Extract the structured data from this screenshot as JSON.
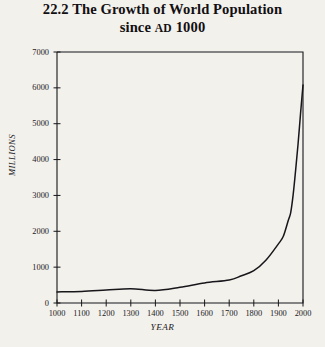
{
  "figure": {
    "title_line_1": "22.2 The Growth of World Population",
    "title_line_2_before": "since ",
    "title_line_2_smallcaps": "AD",
    "title_line_2_after": " 1000",
    "paper_color": "#f3f1ec",
    "ink_color": "#17161a"
  },
  "chart_data": {
    "type": "line",
    "title": "22.2 The Growth of World Population since AD 1000",
    "xlabel": "YEAR",
    "ylabel": "MILLIONS",
    "xlim": [
      1000,
      2000
    ],
    "ylim": [
      0,
      7000
    ],
    "xticks": [
      1000,
      1100,
      1200,
      1300,
      1400,
      1500,
      1600,
      1700,
      1800,
      1900,
      2000
    ],
    "yticks": [
      0,
      1000,
      2000,
      3000,
      4000,
      5000,
      6000,
      7000
    ],
    "xtick_labels": [
      "1000",
      "1100",
      "1200",
      "1300",
      "1400",
      "1500",
      "1600",
      "1700",
      "1800",
      "1900",
      "2000"
    ],
    "ytick_labels": [
      "0",
      "1000",
      "2000",
      "3000",
      "4000",
      "5000",
      "6000",
      "7000"
    ],
    "grid": false,
    "legend": false,
    "line_color": "#17161a",
    "series": [
      {
        "name": "World population",
        "x": [
          1000,
          1100,
          1200,
          1300,
          1400,
          1500,
          1600,
          1700,
          1750,
          1800,
          1850,
          1900,
          1920,
          1940,
          1950,
          1960,
          1970,
          1980,
          1990,
          2000
        ],
        "values": [
          310,
          320,
          360,
          400,
          350,
          440,
          560,
          640,
          760,
          900,
          1200,
          1650,
          1860,
          2300,
          2520,
          3020,
          3700,
          4440,
          5280,
          6080
        ]
      }
    ]
  },
  "axes": {
    "y_title": "MILLIONS",
    "x_title": "YEAR"
  }
}
